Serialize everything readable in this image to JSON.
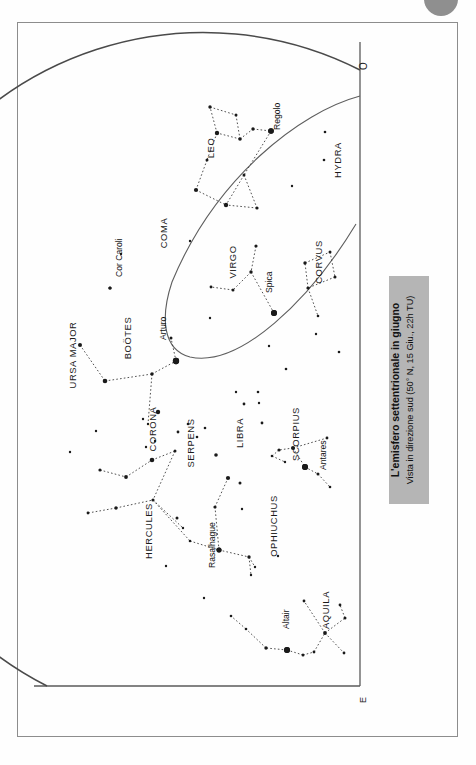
{
  "page": {
    "background_color": "#fefefe",
    "frame_color": "#8d8d8d",
    "star_color": "#1a1a1a",
    "line_color": "#3d3d3d",
    "caption_bg_color": "#b5b5b5"
  },
  "caption": {
    "title": "L'emisfero settentrionale in giugno",
    "subtitle": "Vista in direzione sud (50° N, 15 Giu., 22h TU)"
  },
  "compass": {
    "west_label": "O",
    "east_label": "E"
  },
  "constellations": [
    {
      "name": "HYDRA",
      "x": 341,
      "y": 160
    },
    {
      "name": "LEO",
      "x": 214,
      "y": 148
    },
    {
      "name": "COMA",
      "x": 167,
      "y": 233
    },
    {
      "name": "VIRGO",
      "x": 236,
      "y": 262
    },
    {
      "name": "CORVUS",
      "x": 322,
      "y": 262
    },
    {
      "name": "URSA MAJOR",
      "x": 76,
      "y": 355
    },
    {
      "name": "BOÖTES",
      "x": 131,
      "y": 338
    },
    {
      "name": "CORONA",
      "x": 156,
      "y": 429
    },
    {
      "name": "SERPENS",
      "x": 194,
      "y": 443
    },
    {
      "name": "LIBRA",
      "x": 243,
      "y": 433
    },
    {
      "name": "SCORPIUS",
      "x": 299,
      "y": 434
    },
    {
      "name": "HERCULES",
      "x": 152,
      "y": 531
    },
    {
      "name": "OPHIUCHUS",
      "x": 277,
      "y": 526
    },
    {
      "name": "AQUILA",
      "x": 329,
      "y": 610
    }
  ],
  "named_stars": [
    {
      "name": "Regolo",
      "x": 271,
      "y": 131,
      "label_x": 280,
      "label_y": 130,
      "mag": 5.6
    },
    {
      "name": "Spica",
      "x": 274,
      "y": 313,
      "label_x": 272,
      "label_y": 293,
      "mag": 6.0
    },
    {
      "name": "Arturo",
      "x": 176,
      "y": 361,
      "label_x": 166,
      "label_y": 340,
      "mag": 6.3
    },
    {
      "name": "Cor Caroli",
      "x": 110,
      "y": 288,
      "label_x": 122,
      "label_y": 277,
      "mag": 3.2
    },
    {
      "name": "Antares",
      "x": 305,
      "y": 467,
      "label_x": 326,
      "label_y": 470,
      "mag": 6.0
    },
    {
      "name": "Rasalhague",
      "x": 219,
      "y": 550,
      "label_x": 215,
      "label_y": 568,
      "mag": 5.0
    },
    {
      "name": "Altair",
      "x": 287,
      "y": 650,
      "label_x": 289,
      "label_y": 629,
      "mag": 6.0
    }
  ],
  "chart_data": {
    "type": "scatter",
    "title": "L'emisfero settentrionale in giugno",
    "subtitle": "Vista in direzione sud (50° N, 15 Giu., 22h TU)",
    "projection": "half-dome sky chart, south-facing horizon",
    "grid": false,
    "legend": "none",
    "horizon_arc": {
      "description": "large arc representing the horizon dome edge",
      "cx": 367,
      "cy": 389,
      "r": 319
    },
    "ecliptic_arc": {
      "description": "secondary thin arc crossing chart through Spica and Arturo",
      "points": [
        [
          360,
          95
        ],
        [
          300,
          118
        ],
        [
          240,
          160
        ],
        [
          190,
          225
        ],
        [
          163,
          290
        ],
        [
          150,
          340
        ],
        [
          176,
          361
        ],
        [
          230,
          341
        ],
        [
          274,
          313
        ],
        [
          320,
          268
        ],
        [
          352,
          228
        ]
      ]
    },
    "stars": [
      {
        "x": 210,
        "y": 107,
        "mag": 3.4
      },
      {
        "x": 236,
        "y": 115,
        "mag": 3.0
      },
      {
        "x": 217,
        "y": 133,
        "mag": 4.4
      },
      {
        "x": 240,
        "y": 139,
        "mag": 3.6
      },
      {
        "x": 253,
        "y": 129,
        "mag": 3.4
      },
      {
        "x": 271,
        "y": 131,
        "mag": 5.6
      },
      {
        "x": 207,
        "y": 160,
        "mag": 3.0
      },
      {
        "x": 196,
        "y": 190,
        "mag": 4.2
      },
      {
        "x": 244,
        "y": 175,
        "mag": 3.0
      },
      {
        "x": 226,
        "y": 205,
        "mag": 4.4
      },
      {
        "x": 257,
        "y": 208,
        "mag": 3.2
      },
      {
        "x": 325,
        "y": 132,
        "mag": 2.6
      },
      {
        "x": 324,
        "y": 160,
        "mag": 2.6
      },
      {
        "x": 256,
        "y": 246,
        "mag": 3.2
      },
      {
        "x": 251,
        "y": 272,
        "mag": 3.4
      },
      {
        "x": 233,
        "y": 290,
        "mag": 3.0
      },
      {
        "x": 211,
        "y": 287,
        "mag": 2.8
      },
      {
        "x": 274,
        "y": 313,
        "mag": 6.0
      },
      {
        "x": 305,
        "y": 263,
        "mag": 3.4
      },
      {
        "x": 330,
        "y": 252,
        "mag": 3.0
      },
      {
        "x": 335,
        "y": 277,
        "mag": 3.0
      },
      {
        "x": 308,
        "y": 288,
        "mag": 3.2
      },
      {
        "x": 318,
        "y": 316,
        "mag": 2.6
      },
      {
        "x": 110,
        "y": 288,
        "mag": 3.2
      },
      {
        "x": 80,
        "y": 345,
        "mag": 4.0
      },
      {
        "x": 105,
        "y": 381,
        "mag": 4.6
      },
      {
        "x": 152,
        "y": 374,
        "mag": 3.4
      },
      {
        "x": 176,
        "y": 361,
        "mag": 6.3
      },
      {
        "x": 171,
        "y": 338,
        "mag": 3.0
      },
      {
        "x": 158,
        "y": 412,
        "mag": 4.4
      },
      {
        "x": 148,
        "y": 424,
        "mag": 2.4
      },
      {
        "x": 143,
        "y": 419,
        "mag": 2.4
      },
      {
        "x": 155,
        "y": 441,
        "mag": 2.4
      },
      {
        "x": 146,
        "y": 447,
        "mag": 2.4
      },
      {
        "x": 178,
        "y": 432,
        "mag": 2.8
      },
      {
        "x": 188,
        "y": 424,
        "mag": 2.6
      },
      {
        "x": 197,
        "y": 437,
        "mag": 2.6
      },
      {
        "x": 205,
        "y": 428,
        "mag": 2.6
      },
      {
        "x": 216,
        "y": 455,
        "mag": 3.6
      },
      {
        "x": 244,
        "y": 404,
        "mag": 2.8
      },
      {
        "x": 258,
        "y": 392,
        "mag": 2.6
      },
      {
        "x": 262,
        "y": 423,
        "mag": 2.8
      },
      {
        "x": 305,
        "y": 467,
        "mag": 6.0
      },
      {
        "x": 293,
        "y": 448,
        "mag": 4.0
      },
      {
        "x": 279,
        "y": 450,
        "mag": 3.2
      },
      {
        "x": 272,
        "y": 456,
        "mag": 2.6
      },
      {
        "x": 285,
        "y": 462,
        "mag": 2.4
      },
      {
        "x": 327,
        "y": 438,
        "mag": 2.8
      },
      {
        "x": 318,
        "y": 474,
        "mag": 3.0
      },
      {
        "x": 330,
        "y": 487,
        "mag": 2.6
      },
      {
        "x": 100,
        "y": 470,
        "mag": 3.2
      },
      {
        "x": 126,
        "y": 477,
        "mag": 3.8
      },
      {
        "x": 152,
        "y": 460,
        "mag": 4.6
      },
      {
        "x": 175,
        "y": 451,
        "mag": 3.0
      },
      {
        "x": 116,
        "y": 508,
        "mag": 3.4
      },
      {
        "x": 88,
        "y": 513,
        "mag": 2.8
      },
      {
        "x": 153,
        "y": 500,
        "mag": 3.2
      },
      {
        "x": 177,
        "y": 518,
        "mag": 3.0
      },
      {
        "x": 183,
        "y": 528,
        "mag": 2.4
      },
      {
        "x": 190,
        "y": 541,
        "mag": 2.6
      },
      {
        "x": 219,
        "y": 550,
        "mag": 5.0
      },
      {
        "x": 215,
        "y": 507,
        "mag": 3.2
      },
      {
        "x": 228,
        "y": 478,
        "mag": 4.2
      },
      {
        "x": 240,
        "y": 483,
        "mag": 3.0
      },
      {
        "x": 249,
        "y": 557,
        "mag": 3.4
      },
      {
        "x": 255,
        "y": 567,
        "mag": 2.4
      },
      {
        "x": 251,
        "y": 575,
        "mag": 2.4
      },
      {
        "x": 287,
        "y": 650,
        "mag": 6.0
      },
      {
        "x": 266,
        "y": 648,
        "mag": 3.4
      },
      {
        "x": 303,
        "y": 655,
        "mag": 3.0
      },
      {
        "x": 314,
        "y": 652,
        "mag": 2.8
      },
      {
        "x": 325,
        "y": 633,
        "mag": 3.8
      },
      {
        "x": 345,
        "y": 618,
        "mag": 3.0
      },
      {
        "x": 340,
        "y": 605,
        "mag": 2.8
      },
      {
        "x": 344,
        "y": 653,
        "mag": 2.8
      },
      {
        "x": 304,
        "y": 601,
        "mag": 2.8
      },
      {
        "x": 246,
        "y": 629,
        "mag": 2.6
      },
      {
        "x": 231,
        "y": 616,
        "mag": 2.6
      },
      {
        "x": 259,
        "y": 403,
        "mag": 2.4
      },
      {
        "x": 236,
        "y": 392,
        "mag": 2.4
      },
      {
        "x": 286,
        "y": 369,
        "mag": 2.6
      },
      {
        "x": 339,
        "y": 352,
        "mag": 2.6
      },
      {
        "x": 316,
        "y": 334,
        "mag": 2.4
      },
      {
        "x": 269,
        "y": 346,
        "mag": 2.4
      },
      {
        "x": 210,
        "y": 318,
        "mag": 2.4
      },
      {
        "x": 121,
        "y": 254,
        "mag": 2.4
      },
      {
        "x": 292,
        "y": 186,
        "mag": 2.4
      },
      {
        "x": 190,
        "y": 241,
        "mag": 2.4
      },
      {
        "x": 96,
        "y": 431,
        "mag": 2.4
      },
      {
        "x": 70,
        "y": 452,
        "mag": 2.4
      },
      {
        "x": 242,
        "y": 509,
        "mag": 2.4
      },
      {
        "x": 278,
        "y": 556,
        "mag": 2.4
      },
      {
        "x": 204,
        "y": 598,
        "mag": 2.4
      },
      {
        "x": 166,
        "y": 566,
        "mag": 2.4
      }
    ],
    "constellation_lines": [
      [
        [
          210,
          107
        ],
        [
          236,
          115
        ]
      ],
      [
        [
          236,
          115
        ],
        [
          240,
          139
        ]
      ],
      [
        [
          240,
          139
        ],
        [
          217,
          133
        ]
      ],
      [
        [
          217,
          133
        ],
        [
          210,
          107
        ]
      ],
      [
        [
          240,
          139
        ],
        [
          253,
          129
        ]
      ],
      [
        [
          253,
          129
        ],
        [
          271,
          131
        ]
      ],
      [
        [
          217,
          133
        ],
        [
          207,
          160
        ]
      ],
      [
        [
          207,
          160
        ],
        [
          196,
          190
        ]
      ],
      [
        [
          196,
          190
        ],
        [
          226,
          205
        ]
      ],
      [
        [
          271,
          131
        ],
        [
          244,
          175
        ]
      ],
      [
        [
          244,
          175
        ],
        [
          226,
          205
        ]
      ],
      [
        [
          244,
          175
        ],
        [
          257,
          208
        ]
      ],
      [
        [
          257,
          208
        ],
        [
          226,
          205
        ]
      ],
      [
        [
          256,
          246
        ],
        [
          251,
          272
        ]
      ],
      [
        [
          251,
          272
        ],
        [
          233,
          290
        ]
      ],
      [
        [
          233,
          290
        ],
        [
          211,
          287
        ]
      ],
      [
        [
          251,
          272
        ],
        [
          274,
          313
        ]
      ],
      [
        [
          305,
          263
        ],
        [
          330,
          252
        ]
      ],
      [
        [
          330,
          252
        ],
        [
          335,
          277
        ]
      ],
      [
        [
          335,
          277
        ],
        [
          308,
          288
        ]
      ],
      [
        [
          308,
          288
        ],
        [
          305,
          263
        ]
      ],
      [
        [
          308,
          288
        ],
        [
          318,
          316
        ]
      ],
      [
        [
          80,
          345
        ],
        [
          105,
          381
        ]
      ],
      [
        [
          105,
          381
        ],
        [
          152,
          374
        ]
      ],
      [
        [
          152,
          374
        ],
        [
          176,
          361
        ]
      ],
      [
        [
          176,
          361
        ],
        [
          171,
          338
        ]
      ],
      [
        [
          152,
          374
        ],
        [
          148,
          424
        ]
      ],
      [
        [
          100,
          470
        ],
        [
          126,
          477
        ]
      ],
      [
        [
          126,
          477
        ],
        [
          152,
          460
        ]
      ],
      [
        [
          152,
          460
        ],
        [
          175,
          451
        ]
      ],
      [
        [
          175,
          451
        ],
        [
          153,
          500
        ]
      ],
      [
        [
          153,
          500
        ],
        [
          183,
          528
        ]
      ],
      [
        [
          116,
          508
        ],
        [
          88,
          513
        ]
      ],
      [
        [
          116,
          508
        ],
        [
          153,
          500
        ]
      ],
      [
        [
          153,
          500
        ],
        [
          190,
          541
        ]
      ],
      [
        [
          190,
          541
        ],
        [
          219,
          550
        ]
      ],
      [
        [
          219,
          550
        ],
        [
          215,
          507
        ]
      ],
      [
        [
          215,
          507
        ],
        [
          228,
          478
        ]
      ],
      [
        [
          219,
          550
        ],
        [
          249,
          557
        ]
      ],
      [
        [
          249,
          557
        ],
        [
          255,
          567
        ]
      ],
      [
        [
          249,
          557
        ],
        [
          251,
          575
        ]
      ],
      [
        [
          293,
          448
        ],
        [
          279,
          450
        ]
      ],
      [
        [
          279,
          450
        ],
        [
          272,
          456
        ]
      ],
      [
        [
          272,
          456
        ],
        [
          285,
          462
        ]
      ],
      [
        [
          293,
          448
        ],
        [
          327,
          438
        ]
      ],
      [
        [
          293,
          448
        ],
        [
          305,
          467
        ]
      ],
      [
        [
          305,
          467
        ],
        [
          318,
          474
        ]
      ],
      [
        [
          318,
          474
        ],
        [
          330,
          487
        ]
      ],
      [
        [
          287,
          650
        ],
        [
          266,
          648
        ]
      ],
      [
        [
          287,
          650
        ],
        [
          303,
          655
        ]
      ],
      [
        [
          303,
          655
        ],
        [
          314,
          652
        ]
      ],
      [
        [
          314,
          652
        ],
        [
          325,
          633
        ]
      ],
      [
        [
          325,
          633
        ],
        [
          345,
          618
        ]
      ],
      [
        [
          345,
          618
        ],
        [
          340,
          605
        ]
      ],
      [
        [
          325,
          633
        ],
        [
          344,
          653
        ]
      ],
      [
        [
          325,
          633
        ],
        [
          304,
          601
        ]
      ],
      [
        [
          266,
          648
        ],
        [
          246,
          629
        ]
      ],
      [
        [
          246,
          629
        ],
        [
          231,
          616
        ]
      ]
    ]
  }
}
